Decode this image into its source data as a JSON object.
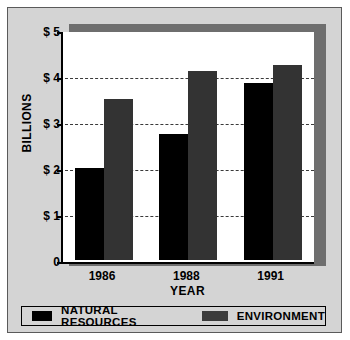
{
  "chart_data": {
    "type": "bar",
    "title": "",
    "categories": [
      "1986",
      "1988",
      "1991"
    ],
    "series": [
      {
        "name": "NATURAL RESOURCES",
        "color": "#000000",
        "values": [
          2.0,
          2.75,
          3.85
        ]
      },
      {
        "name": "ENVIRONMENT",
        "color": "#333333",
        "values": [
          3.5,
          4.1,
          4.25
        ]
      }
    ],
    "xlabel": "YEAR",
    "ylabel": "BILLIONS",
    "ylim": [
      0,
      5
    ],
    "yticks": [
      {
        "value": 5,
        "label": "$ 5"
      },
      {
        "value": 4,
        "label": "$ 4"
      },
      {
        "value": 3,
        "label": "$ 3"
      },
      {
        "value": 2,
        "label": "$ 2"
      },
      {
        "value": 1,
        "label": "$ 1"
      },
      {
        "value": 0,
        "label": "0"
      }
    ],
    "gridlines": [
      4,
      3,
      2,
      1
    ],
    "grid": true,
    "legend_position": "bottom"
  },
  "legend": {
    "items": [
      {
        "label": "NATURAL RESOURCES",
        "color": "#000000"
      },
      {
        "label": "ENVIRONMENT",
        "color": "#3b3b3b"
      }
    ]
  },
  "colors": {
    "background": "#d4d4d4",
    "panel": "#ffffff",
    "shadow": "#6e6e6e",
    "axis": "#000000",
    "grid": "#3a3a3a"
  }
}
